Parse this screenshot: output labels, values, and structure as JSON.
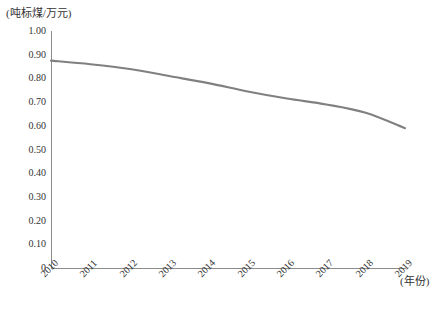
{
  "chart_data": {
    "type": "line",
    "title": "",
    "xlabel": "(年份)",
    "ylabel": "(吨标煤/万元)",
    "x": [
      "2010",
      "2011",
      "2012",
      "2013",
      "2014",
      "2015",
      "2016",
      "2017",
      "2018",
      "2019"
    ],
    "categories": [
      "2010",
      "2011",
      "2012",
      "2013",
      "2014",
      "2015",
      "2016",
      "2017",
      "2018",
      "2019"
    ],
    "values": [
      0.875,
      0.86,
      0.84,
      0.81,
      0.78,
      0.745,
      0.715,
      0.69,
      0.655,
      0.59
    ],
    "series": [
      {
        "name": "单位GDP能耗",
        "values": [
          0.875,
          0.86,
          0.84,
          0.81,
          0.78,
          0.745,
          0.715,
          0.69,
          0.655,
          0.59
        ],
        "color": "#808080"
      }
    ],
    "ylim": [
      0,
      1.0
    ],
    "ytick_step": 0.1,
    "ytick_labels": [
      "1.00",
      "0.90",
      "0.80",
      "0.70",
      "0.60",
      "0.50",
      "0.40",
      "0.30",
      "0.20",
      "0.10",
      "0"
    ],
    "ytick_values": [
      1.0,
      0.9,
      0.8,
      0.7,
      0.6,
      0.5,
      0.4,
      0.3,
      0.2,
      0.1,
      0
    ],
    "grid": false,
    "legend": "none",
    "line_color": "#808080",
    "axis_color": "#8c8c8c"
  },
  "axes": {
    "y_unit": "(吨标煤/万元)",
    "x_unit": "(年份)"
  }
}
